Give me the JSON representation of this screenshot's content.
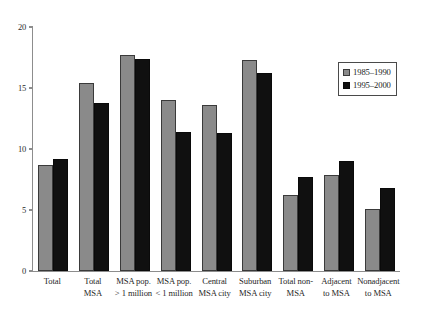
{
  "chart_data": {
    "type": "bar",
    "title": "",
    "xlabel": "",
    "ylabel": "",
    "ylim": [
      0,
      20
    ],
    "yticks": [
      0,
      5,
      10,
      15,
      20
    ],
    "ytick_labels": [
      "0",
      "5",
      "10",
      "15",
      "20"
    ],
    "grid": false,
    "legend_position": "upper right",
    "categories": [
      "Total",
      "Total\nMSA",
      "MSA pop.\n> 1 million",
      "MSA pop.\n< 1 million",
      "Central\nMSA city",
      "Suburban\nMSA city",
      "Total non-\nMSA",
      "Adjacent\nto MSA",
      "Nonadjacent\nto MSA"
    ],
    "series": [
      {
        "name": "1985–1990",
        "color": "#8a8a8a",
        "values": [
          8.7,
          15.4,
          17.7,
          14.0,
          13.6,
          17.3,
          6.2,
          7.9,
          5.1
        ]
      },
      {
        "name": "1995–2000",
        "color": "#101010",
        "values": [
          9.2,
          13.8,
          17.4,
          11.4,
          11.3,
          16.2,
          7.7,
          9.0,
          6.8
        ]
      }
    ]
  },
  "axis": {
    "y_max_label": "20",
    "y_min_label": "0"
  }
}
